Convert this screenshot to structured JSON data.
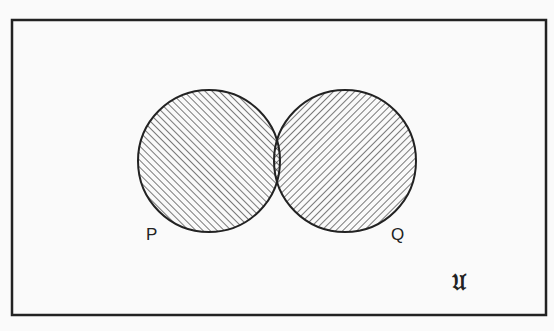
{
  "diagram": {
    "type": "venn",
    "universe_label": "𝔘",
    "sets": [
      {
        "name": "P",
        "label": "P",
        "hatch": "forward-diagonal"
      },
      {
        "name": "Q",
        "label": "Q",
        "hatch": "backward-diagonal"
      }
    ],
    "intersection": {
      "label": "P ∩ Q",
      "hatch": "cross-hatch"
    },
    "colors": {
      "stroke": "#222222",
      "background": "#fafafa"
    }
  }
}
